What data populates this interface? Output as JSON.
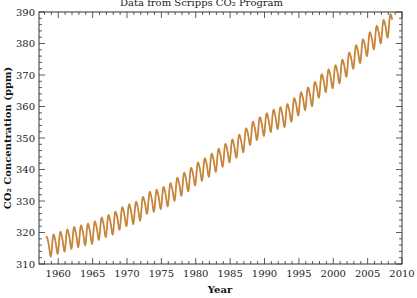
{
  "chart_data": {
    "type": "line",
    "title": "Data from Scripps CO₂ Program",
    "xlabel": "Year",
    "ylabel": "CO₂ Concentration (ppm)",
    "xlim": [
      1957.2,
      2010
    ],
    "ylim": [
      310,
      390
    ],
    "x_ticks": [
      1960,
      1965,
      1970,
      1975,
      1980,
      1985,
      1990,
      1995,
      2000,
      2005,
      2010
    ],
    "y_ticks": [
      310,
      320,
      330,
      340,
      350,
      360,
      370,
      380,
      390
    ],
    "grid": false,
    "legend": null,
    "series": [
      {
        "name": "Monthly CO2 (Mauna Loa)",
        "color": "#e0873a",
        "line_color": "#9a8a4a",
        "seasonal_amplitude_ppm": 3.2,
        "annual_means": {
          "x": [
            1958,
            1959,
            1960,
            1961,
            1962,
            1963,
            1964,
            1965,
            1966,
            1967,
            1968,
            1969,
            1970,
            1971,
            1972,
            1973,
            1974,
            1975,
            1976,
            1977,
            1978,
            1979,
            1980,
            1981,
            1982,
            1983,
            1984,
            1985,
            1986,
            1987,
            1988,
            1989,
            1990,
            1991,
            1992,
            1993,
            1994,
            1995,
            1996,
            1997,
            1998,
            1999,
            2000,
            2001,
            2002,
            2003,
            2004,
            2005,
            2006,
            2007,
            2008
          ],
          "values": [
            315.3,
            316.0,
            316.9,
            317.6,
            318.5,
            319.0,
            319.6,
            320.0,
            321.4,
            322.2,
            323.0,
            324.6,
            325.7,
            326.3,
            327.5,
            329.7,
            330.2,
            331.1,
            332.0,
            333.8,
            335.4,
            336.8,
            338.7,
            340.1,
            341.4,
            343.0,
            344.6,
            346.0,
            347.4,
            349.2,
            351.6,
            353.1,
            354.4,
            355.6,
            356.5,
            357.1,
            358.9,
            360.9,
            362.6,
            363.8,
            366.6,
            368.3,
            369.5,
            371.1,
            373.2,
            375.8,
            377.5,
            379.8,
            381.9,
            383.8,
            385.6
          ]
        }
      }
    ]
  }
}
